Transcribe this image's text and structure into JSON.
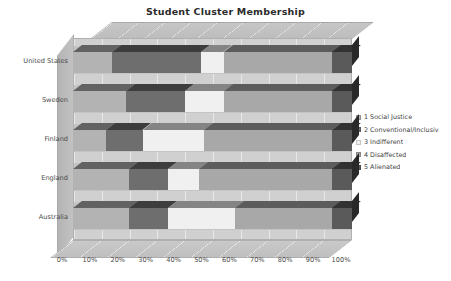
{
  "chart_data": {
    "type": "bar",
    "subtype": "stacked-horizontal-3d",
    "title": "Student Cluster Membership",
    "xlabel": "",
    "ylabel": "",
    "xlim": [
      0,
      100
    ],
    "x_unit": "%",
    "grid": true,
    "legend_position": "right",
    "categories": [
      "United States",
      "Sweden",
      "Finland",
      "England",
      "Australia"
    ],
    "xticks": [
      "0%",
      "10%",
      "20%",
      "30%",
      "40%",
      "50%",
      "60%",
      "70%",
      "80%",
      "90%",
      "100%"
    ],
    "xtick_values": [
      0,
      10,
      20,
      30,
      40,
      50,
      60,
      70,
      80,
      90,
      100
    ],
    "series": [
      {
        "name": "1 Social Justice",
        "color": "#b3b3b3",
        "values": [
          14,
          19,
          12,
          20,
          20
        ]
      },
      {
        "name": "2 Conventional/Inclusive",
        "color": "#6e6e6e",
        "values": [
          32,
          21,
          13,
          14,
          14
        ]
      },
      {
        "name": "3 Indifferent",
        "color": "#f0f0f0",
        "values": [
          8,
          14,
          22,
          11,
          24
        ]
      },
      {
        "name": "4 Disaffected",
        "color": "#a8a8a8",
        "values": [
          39,
          39,
          46,
          48,
          35
        ]
      },
      {
        "name": "5 Alienated",
        "color": "#5a5a5a",
        "values": [
          7,
          7,
          7,
          7,
          7
        ]
      }
    ]
  },
  "legend": {
    "items": [
      {
        "label": "1 Social Justice",
        "color": "#b3b3b3"
      },
      {
        "label": "2 Conventional/Inclusiv",
        "color": "#6e6e6e"
      },
      {
        "label": "3 Indifferent",
        "color": "#f0f0f0"
      },
      {
        "label": "4 Disaffected",
        "color": "#a8a8a8"
      },
      {
        "label": "5 Alienated",
        "color": "#5a5a5a"
      }
    ]
  }
}
